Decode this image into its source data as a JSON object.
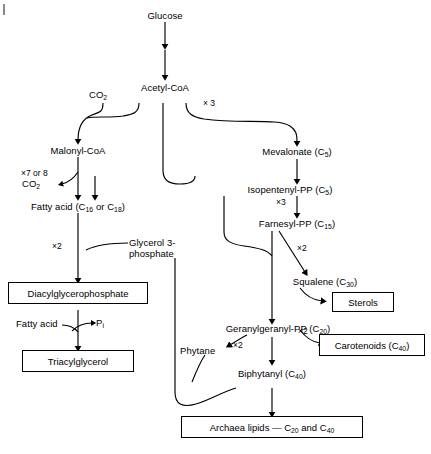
{
  "figure": {
    "background_color": "#ffffff",
    "line_color": "#000000",
    "width": 431,
    "height": 454
  },
  "nodes": {
    "glucose": "Glucose",
    "acetyl_coa": "Acetyl-CoA",
    "co2_top": "CO",
    "co2_top_sub": "2",
    "malonyl_coa": "Malonyl-CoA",
    "co2_left": "CO",
    "co2_left_sub": "2",
    "fatty_acid_main_pre": "Fatty acid (C",
    "fatty_acid_sub1": "16",
    "fatty_acid_mid": " or C",
    "fatty_acid_sub2": "18",
    "fatty_acid_end": ")",
    "glycerol_3_phosphate_line1": "Glycerol 3-",
    "glycerol_3_phosphate_line2": "phosphate",
    "diacylglycerophosphate": "Diacylglycerophosphate",
    "fatty_acid_second": "Fatty acid",
    "pi_pre": "P",
    "pi_sub": "i",
    "triacylglycerol": "Triacylglycerol",
    "mevalonate_pre": "Mevalonate (C",
    "mevalonate_sub": "5",
    "mevalonate_end": ")",
    "isopentenyl_pp_pre": "Isopentenyl-PP (C",
    "isopentenyl_pp_sub": "5",
    "isopentenyl_pp_end": ")",
    "farnesyl_pp_pre": "Farnesyl-PP (C",
    "farnesyl_pp_sub": "15",
    "farnesyl_pp_end": ")",
    "squalene_pre": "Squalene (C",
    "squalene_sub": "30",
    "squalene_end": ")",
    "sterols": "Sterols",
    "geranylgeranyl_pp_pre": "Geranylgeranyl-PP (C",
    "geranylgeranyl_pp_sub": "20",
    "geranylgeranyl_pp_end": ")",
    "carotenoids_pre": "Carotenoids (C",
    "carotenoids_sub": "40",
    "carotenoids_end": ")",
    "phytane": "Phytane",
    "biphytanyl_pre": "Biphytanyl (C",
    "biphytanyl_sub": "40",
    "biphytanyl_end": ")",
    "archaea_lipids_pre": "Archaea lipids — C",
    "archaea_lipids_sub1": "20",
    "archaea_lipids_mid": " and C",
    "archaea_lipids_sub2": "40"
  },
  "stoichiometry_labels": {
    "acetyl_to_mevalonate": "× 3",
    "malonyl_cycles": "×7 or 8",
    "fatty_acid_to_dag": "×2",
    "isopentenyl_to_farnesyl": "×3",
    "farnesyl_to_squalene": "×2",
    "ggpp_to_phytane": "×2",
    "ggpp_to_carotenoids": "×2"
  },
  "boxed_products": [
    "Diacylglycerophosphate",
    "Triacylglycerol",
    "Sterols",
    "Carotenoids (C40)",
    "Archaea lipids — C20 and C40"
  ],
  "caption": ""
}
